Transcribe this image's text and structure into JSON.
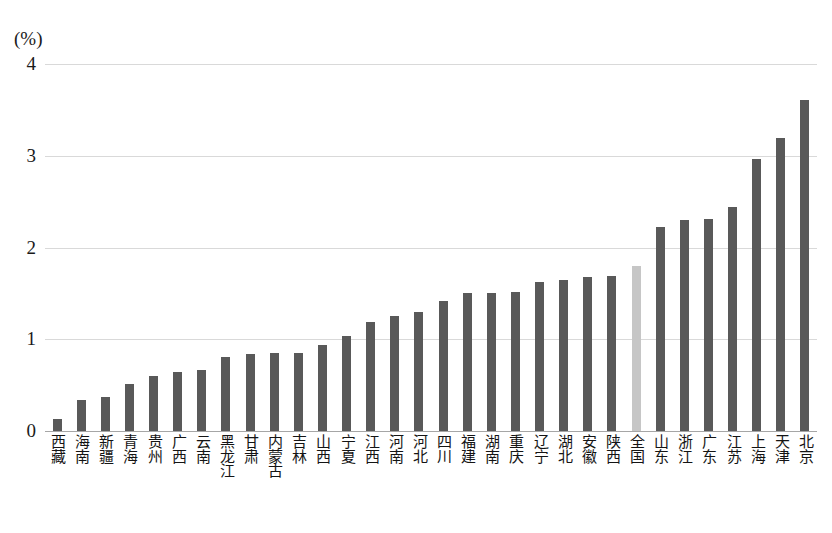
{
  "axis": {
    "unit_label": "(%)",
    "y_ticks": [
      "0",
      "1",
      "2",
      "3",
      "4"
    ],
    "y_min": 0,
    "y_max": 4
  },
  "chart_data": {
    "type": "bar",
    "title": "",
    "xlabel": "",
    "ylabel": "(%)",
    "ylim": [
      0,
      4
    ],
    "grid": true,
    "legend": "none",
    "highlight_category": "全国",
    "colors": {
      "bar": "#595959",
      "highlight_bar": "#c6c6c6",
      "gridline": "#d9d9d9",
      "axis": "#a6a6a6",
      "text": "#1a1a1a"
    },
    "categories": [
      "西藏",
      "海南",
      "新疆",
      "青海",
      "贵州",
      "广西",
      "云南",
      "黑龙江",
      "甘肃",
      "内蒙古",
      "吉林",
      "山西",
      "宁夏",
      "江西",
      "河南",
      "河北",
      "四川",
      "福建",
      "湖南",
      "重庆",
      "辽宁",
      "湖北",
      "安徽",
      "陕西",
      "全国",
      "山东",
      "浙江",
      "广东",
      "江苏",
      "上海",
      "天津",
      "北京"
    ],
    "values": [
      0.13,
      0.34,
      0.37,
      0.51,
      0.6,
      0.64,
      0.67,
      0.81,
      0.84,
      0.85,
      0.85,
      0.94,
      1.04,
      1.19,
      1.25,
      1.3,
      1.42,
      1.5,
      1.5,
      1.52,
      1.62,
      1.65,
      1.68,
      1.69,
      1.8,
      2.22,
      2.3,
      2.31,
      2.44,
      2.96,
      3.19,
      3.61
    ]
  }
}
